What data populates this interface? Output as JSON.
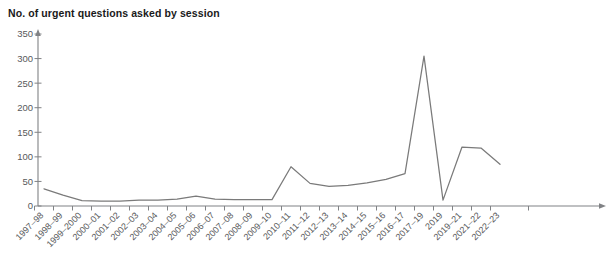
{
  "chart_data": {
    "type": "line",
    "title": "No. of urgent questions asked by session",
    "xlabel": "",
    "ylabel": "",
    "ylim": [
      0,
      350
    ],
    "yticks": [
      0,
      50,
      100,
      150,
      200,
      250,
      300,
      350
    ],
    "grid": false,
    "legend": null,
    "line_color": "#7a7a7a",
    "categories": [
      "1997–98",
      "1998–99",
      "1999–2000",
      "2000–01",
      "2001–02",
      "2002–03",
      "2003–04",
      "2004–05",
      "2005–06",
      "2006–07",
      "2007–08",
      "2008–09",
      "2009–10",
      "2010–11",
      "2011–12",
      "2012–13",
      "2013–14",
      "2014–15",
      "2015–16",
      "2016–17",
      "2017–19",
      "2019",
      "2019–21",
      "2021–22",
      "2022–23"
    ],
    "values": [
      35,
      22,
      11,
      10,
      10,
      12,
      12,
      14,
      20,
      14,
      13,
      13,
      13,
      80,
      46,
      40,
      42,
      47,
      54,
      66,
      305,
      12,
      120,
      118,
      85
    ],
    "series": [
      {
        "name": "No. of urgent questions asked by session",
        "values": [
          35,
          22,
          11,
          10,
          10,
          12,
          12,
          14,
          20,
          14,
          13,
          13,
          13,
          80,
          46,
          40,
          42,
          47,
          54,
          66,
          305,
          12,
          120,
          118,
          85
        ]
      }
    ]
  },
  "axes": {
    "y_tick_labels": [
      "350",
      "300",
      "250",
      "200",
      "150",
      "100",
      "50",
      "0"
    ],
    "x_tick_labels": [
      "1997–98",
      "1998–99",
      "1999–2000",
      "2000–01",
      "2001–02",
      "2002–03",
      "2003–04",
      "2004–05",
      "2005–06",
      "2006–07",
      "2007–08",
      "2008–09",
      "2009–10",
      "2010–11",
      "2011–12",
      "2012–13",
      "2013–14",
      "2014–15",
      "2015–16",
      "2016–17",
      "2017–19",
      "2019",
      "2019–21",
      "2021–22",
      "2022–23"
    ]
  }
}
